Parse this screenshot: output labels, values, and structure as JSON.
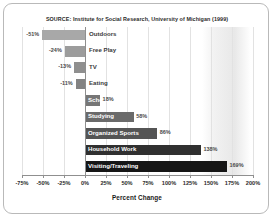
{
  "source_note": "SOURCE: Institute for Social Research, University of Michigan (1999)",
  "axis_title": "Percent Change",
  "chart_data": {
    "type": "bar",
    "orientation": "horizontal",
    "title": "",
    "subtitle": "SOURCE: Institute for Social Research, University of Michigan (1999)",
    "xlabel": "Percent Change",
    "ylabel": "",
    "xlim": [
      -75,
      200
    ],
    "grid": true,
    "legend": "none",
    "xticks": [
      -75,
      -50,
      -25,
      0,
      25,
      50,
      75,
      100,
      125,
      150,
      175,
      200
    ],
    "xticklabels": [
      "-75%",
      "-50%",
      "-25%",
      "0%",
      "25%",
      "50%",
      "75%",
      "100%",
      "125%",
      "150%",
      "175%",
      "200%"
    ],
    "categories": [
      "Outdoors",
      "Free Play",
      "TV",
      "Eating",
      "School",
      "Studying",
      "Organized Sports",
      "Household Work",
      "Visiting/Traveling"
    ],
    "values": [
      -51,
      -24,
      -13,
      -11,
      18,
      58,
      86,
      138,
      169
    ],
    "value_labels": [
      "-51%",
      "-24%",
      "-13%",
      "-11%",
      "18%",
      "58%",
      "86%",
      "138%",
      "169%"
    ],
    "bar_colors": [
      "#a8a8a8",
      "#9c9c9c",
      "#8f8f8f",
      "#838383",
      "#767676",
      "#6a6a6a",
      "#545454",
      "#303030",
      "#161616"
    ],
    "label_colors": [
      "#3a3a3a",
      "#3a3a3a",
      "#3a3a3a",
      "#3a3a3a",
      "#ffffff",
      "#ffffff",
      "#ffffff",
      "#ffffff",
      "#ffffff"
    ]
  }
}
